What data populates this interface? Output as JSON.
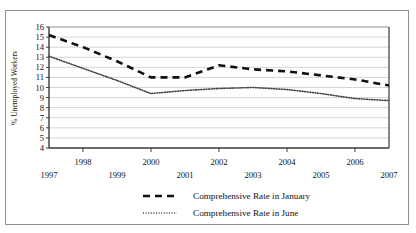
{
  "chart_data": {
    "type": "line",
    "title": "",
    "subtitle": "",
    "xlabel": "",
    "ylabel": "% Unemployed Workers",
    "x": [
      1997,
      1998,
      1999,
      2000,
      2001,
      2002,
      2003,
      2004,
      2005,
      2006,
      2007
    ],
    "xtick_labels": [
      "1997",
      "1998",
      "1999",
      "2000",
      "2001",
      "2002",
      "2003",
      "2004",
      "2005",
      "2006",
      "2007"
    ],
    "ytick_labels": [
      "16",
      "15",
      "14",
      "13",
      "12",
      "11",
      "10",
      "9",
      "8",
      "7",
      "6",
      "5",
      "4"
    ],
    "ytick_values": [
      16,
      15,
      14,
      13,
      12,
      11,
      10,
      9,
      8,
      7,
      6,
      5,
      4
    ],
    "xlim": [
      1997,
      2007
    ],
    "ylim": [
      4,
      16
    ],
    "grid": "horizontal",
    "legend_position": "bottom",
    "series": [
      {
        "name": "Comprehensive Rate in January",
        "style": "dashed",
        "color": "#111111",
        "values": [
          15.2,
          14.0,
          12.6,
          11.0,
          11.0,
          12.2,
          11.8,
          11.6,
          11.2,
          10.8,
          10.2
        ]
      },
      {
        "name": "Comprehensive Rate in June",
        "style": "dotted",
        "color": "#444444",
        "values": [
          13.1,
          11.9,
          10.7,
          9.4,
          9.7,
          9.9,
          10.0,
          9.8,
          9.4,
          8.9,
          8.7
        ]
      }
    ]
  },
  "legend": {
    "items": [
      {
        "label": "Comprehensive Rate in January",
        "style": "dashed"
      },
      {
        "label": "Comprehensive Rate in June",
        "style": "dotted"
      }
    ]
  },
  "axes": {
    "y_title": "% Unemployed Workers"
  },
  "colors": {
    "frame": "#8d8f92",
    "plot_border": "#3a3a3a",
    "gridline": "#c9c9c9",
    "series_january": "#111111",
    "series_june": "#444444",
    "background": "#ffffff"
  }
}
